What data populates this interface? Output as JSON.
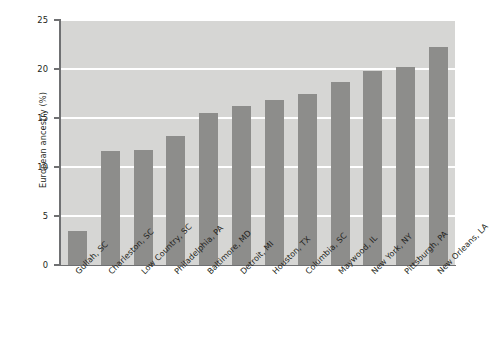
{
  "chart_data": {
    "type": "bar",
    "title": "",
    "subtitle": "",
    "xlabel": "",
    "ylabel": "European ancestry (%)",
    "ylim": [
      0,
      25
    ],
    "yticks": [
      0,
      5,
      10,
      15,
      20,
      25
    ],
    "ytick_labels": [
      "0",
      "5",
      "10",
      "15",
      "20",
      "25"
    ],
    "grid": true,
    "grid_axis": "y",
    "legend": false,
    "legend_position": "none",
    "orientation": "vertical",
    "categories": [
      "Gullah, SC",
      "Charleston, SC",
      "Low Country, SC",
      "Philadelphia, PA",
      "Baltimore, MD",
      "Detroit, MI",
      "Houston, TX",
      "Columbia, SC",
      "Maywood, IL",
      "New York, NY",
      "Pittsburgh, PA",
      "New Orleans, LA"
    ],
    "values": [
      3.5,
      11.6,
      11.7,
      13.2,
      15.5,
      16.2,
      16.8,
      17.5,
      18.7,
      19.8,
      20.2,
      22.2
    ],
    "bar_color": "#8d8d8b",
    "plot_background": "#d6d6d4",
    "gridline_color": "#ffffff",
    "axis_color": "#6f7072",
    "text_color": "#231f20",
    "figure_background": "#ffffff"
  }
}
